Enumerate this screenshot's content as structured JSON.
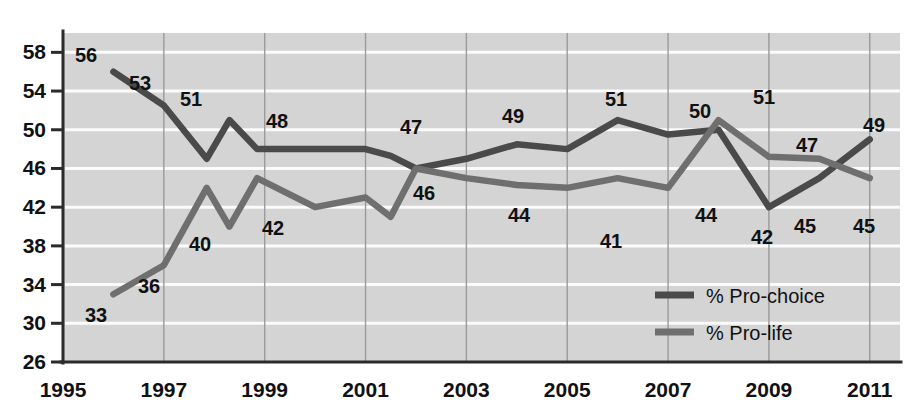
{
  "chart_data": {
    "type": "line",
    "title": "",
    "subtitle": "",
    "xlabel": "",
    "ylabel": "",
    "xlim": [
      1995,
      2011.6
    ],
    "ylim": [
      26,
      60
    ],
    "grid": true,
    "legend_position": "inside-bottom-right",
    "x_tick_labels": [
      "1995",
      "1997",
      "1999",
      "2001",
      "2003",
      "2005",
      "2007",
      "2009",
      "2011"
    ],
    "x_ticks": [
      1995,
      1997,
      1999,
      2001,
      2003,
      2005,
      2007,
      2009,
      2011
    ],
    "y_tick_labels": [
      "26",
      "30",
      "34",
      "38",
      "42",
      "46",
      "50",
      "54",
      "58"
    ],
    "y_ticks": [
      26,
      30,
      34,
      38,
      42,
      46,
      50,
      54,
      58
    ],
    "series": [
      {
        "name": "% Pro-choice",
        "color": "#4a4a4a",
        "x": [
          1996.0,
          1997.0,
          1997.85,
          1998.3,
          1998.85,
          2000.0,
          2001.0,
          2001.5,
          2002.0,
          2003.0,
          2004.0,
          2005.0,
          2006.0,
          2007.0,
          2008.0,
          2009.0,
          2010.0,
          2011.0
        ],
        "values": [
          56,
          52.5,
          47,
          51,
          48,
          48,
          48,
          47.3,
          46,
          47,
          48.5,
          48,
          51,
          49.5,
          50,
          42,
          45,
          49
        ]
      },
      {
        "name": "% Pro-life",
        "color": "#6f6f6f",
        "x": [
          1996.0,
          1997.0,
          1997.85,
          1998.3,
          1998.85,
          2000.0,
          2001.0,
          2001.5,
          2002.0,
          2003.0,
          2004.0,
          2005.0,
          2006.0,
          2007.0,
          2008.0,
          2009.0,
          2010.0,
          2011.0
        ],
        "values": [
          33,
          36,
          44,
          40,
          45,
          42,
          43,
          41,
          46,
          45,
          44.3,
          44,
          45,
          44,
          51,
          47.2,
          47,
          45
        ]
      }
    ],
    "annotations": [
      {
        "text": "56",
        "x": 86,
        "y": 62,
        "series": "% Pro-choice"
      },
      {
        "text": "53",
        "x": 140,
        "y": 90,
        "series": "% Pro-choice"
      },
      {
        "text": "51",
        "x": 191,
        "y": 106,
        "series": "% Pro-choice"
      },
      {
        "text": "48",
        "x": 277,
        "y": 128,
        "series": "% Pro-choice"
      },
      {
        "text": "47",
        "x": 411,
        "y": 134,
        "series": "% Pro-choice"
      },
      {
        "text": "49",
        "x": 513,
        "y": 123,
        "series": "% Pro-choice"
      },
      {
        "text": "51",
        "x": 616,
        "y": 106,
        "series": "% Pro-choice"
      },
      {
        "text": "50",
        "x": 700,
        "y": 118,
        "series": "% Pro-choice"
      },
      {
        "text": "51",
        "x": 764,
        "y": 104,
        "series": "% Pro-choice"
      },
      {
        "text": "49",
        "x": 874,
        "y": 132,
        "series": "% Pro-choice"
      },
      {
        "text": "42",
        "x": 762,
        "y": 244,
        "series": "% Pro-choice"
      },
      {
        "text": "45",
        "x": 805,
        "y": 233,
        "series": "% Pro-choice"
      },
      {
        "text": "33",
        "x": 96,
        "y": 322,
        "series": "% Pro-life"
      },
      {
        "text": "36",
        "x": 149,
        "y": 293,
        "series": "% Pro-life"
      },
      {
        "text": "40",
        "x": 200,
        "y": 251,
        "series": "% Pro-life"
      },
      {
        "text": "42",
        "x": 273,
        "y": 235,
        "series": "% Pro-life"
      },
      {
        "text": "46",
        "x": 424,
        "y": 200,
        "series": "% Pro-life"
      },
      {
        "text": "44",
        "x": 519,
        "y": 222,
        "series": "% Pro-life"
      },
      {
        "text": "41",
        "x": 611,
        "y": 248,
        "series": "% Pro-life"
      },
      {
        "text": "44",
        "x": 706,
        "y": 222,
        "series": "% Pro-life"
      },
      {
        "text": "47",
        "x": 807,
        "y": 152,
        "series": "% Pro-life"
      },
      {
        "text": "45",
        "x": 864,
        "y": 233,
        "series": "% Pro-life"
      }
    ],
    "legend": [
      {
        "label": "% Pro-choice",
        "color": "#4a4a4a"
      },
      {
        "label": "% Pro-life",
        "color": "#6f6f6f"
      }
    ],
    "colors": {
      "plot_background": "#d4d4d4",
      "horizontal_gridline": "#fbfbfb",
      "vertical_gridline": "#9a9a9a",
      "axis": "#2b2b2b",
      "text": "#111111",
      "pro_choice": "#4a4a4a",
      "pro_life": "#6f6f6f"
    }
  }
}
